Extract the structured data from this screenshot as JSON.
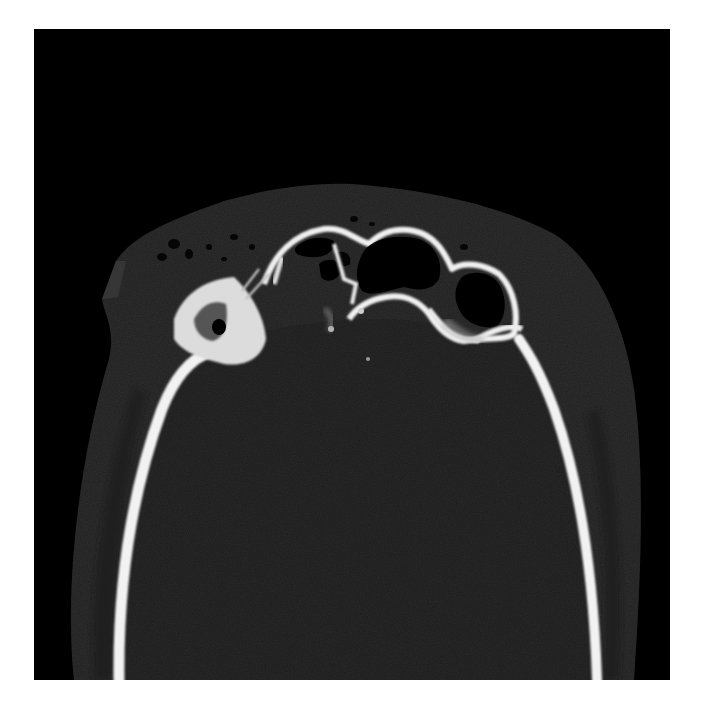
{
  "image": {
    "kind": "axial CT scan (bone window)",
    "region": "skull at level of frontal sinuses / orbital roofs",
    "background_color": "#ffffff",
    "field_color": "#000000",
    "bone_color": "#f4f4f4",
    "brain_color": "#2a2a2a",
    "soft_tissue_color": "#2e2e2e",
    "air_color": "#000000"
  }
}
